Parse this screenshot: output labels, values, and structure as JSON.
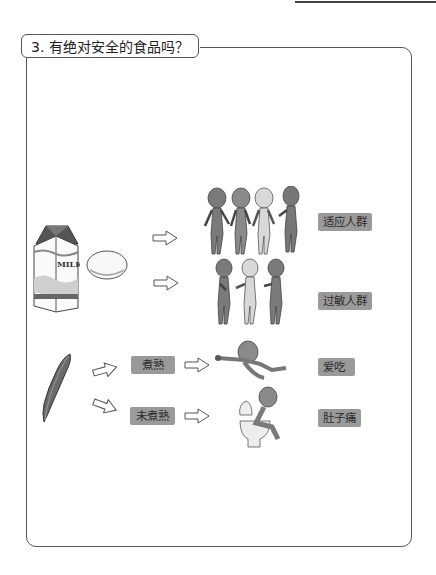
{
  "section": {
    "title": "3. 有绝对安全的食品吗？"
  },
  "diagram": {
    "foods": {
      "milk_label": "MILK"
    },
    "groups": [
      {
        "label": "适应人群"
      },
      {
        "label": "过敏人群"
      }
    ],
    "bean": {
      "conditions": [
        {
          "label": "煮熟",
          "result": "爱吃"
        },
        {
          "label": "未煮熟",
          "result": "肚子痛"
        }
      ]
    }
  },
  "colors": {
    "label_bg": "#9a9a9a",
    "border": "#555555",
    "figure_dark": "#7a7a7a",
    "figure_light": "#d8d8d8"
  }
}
